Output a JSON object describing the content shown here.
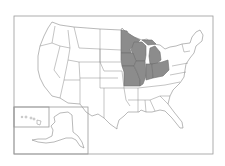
{
  "map": {
    "title": "United States map with highlighted Midwest states",
    "fill_colors": {
      "default": "#ffffff",
      "highlighted": "#8c8c8c",
      "border": "#8a8a8a"
    },
    "highlighted_states": [
      "Minnesota",
      "Wisconsin",
      "Michigan",
      "Iowa",
      "Missouri",
      "Illinois",
      "Indiana",
      "Ohio"
    ],
    "insets": [
      "Alaska",
      "Hawaii"
    ]
  }
}
